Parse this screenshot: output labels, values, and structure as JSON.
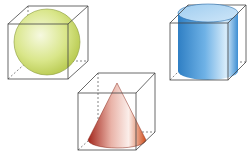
{
  "diagram": {
    "solids": [
      {
        "name": "sphere",
        "color": "#d4e27a"
      },
      {
        "name": "cylinder",
        "color": "#4f9fdc"
      },
      {
        "name": "cone",
        "color": "#c23a2a"
      }
    ],
    "line_color": "#444444"
  }
}
